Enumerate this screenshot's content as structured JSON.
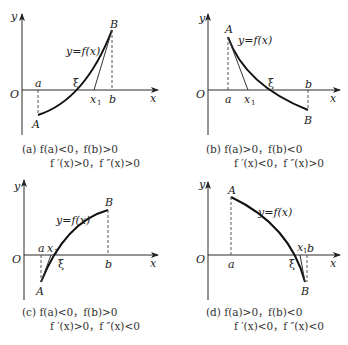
{
  "figure": {
    "panels": [
      {
        "id": "a",
        "labels": {
          "y_axis": "y",
          "x_axis": "x",
          "origin": "O",
          "a": "a",
          "b": "b",
          "xi": "ξ",
          "x1": "x",
          "x1_sub": "1",
          "A": "A",
          "B": "B",
          "curve": "y=f(x)"
        },
        "caption_line1": "(a)  f(a)<0，f(b)>0",
        "caption_line2": "f ′(x)>0，f ″(x)>0"
      },
      {
        "id": "b",
        "labels": {
          "y_axis": "y",
          "x_axis": "x",
          "origin": "O",
          "a": "a",
          "b": "b",
          "xi": "ξ",
          "x1": "x",
          "x1_sub": "1",
          "A": "A",
          "B": "B",
          "curve": "y=f(x)"
        },
        "caption_line1": "(b)  f(a)>0，f(b)<0",
        "caption_line2": "f ′(x)<0，f ″(x)>0"
      },
      {
        "id": "c",
        "labels": {
          "y_axis": "y",
          "x_axis": "x",
          "origin": "O",
          "a": "a",
          "b": "b",
          "xi": "ξ",
          "x1": "x",
          "x1_sub": "1",
          "A": "A",
          "B": "B",
          "curve": "y=f(x)"
        },
        "caption_line1": "(c)  f(a)<0，f(b)>0",
        "caption_line2": "f ′(x)>0，f ″(x)<0"
      },
      {
        "id": "d",
        "labels": {
          "y_axis": "y",
          "x_axis": "x",
          "origin": "O",
          "a": "a",
          "b": "b",
          "xi": "ξ",
          "x1": "x",
          "x1_sub": "1",
          "A": "A",
          "B": "B",
          "curve": "y=f(x)"
        },
        "caption_line1": "(d)  f(a)>0，f(b)<0",
        "caption_line2": "f ′(x)<0，f ″(x)<0"
      }
    ]
  }
}
